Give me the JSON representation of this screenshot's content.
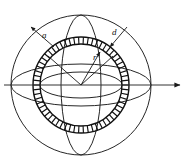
{
  "figure": {
    "background_color": "#ffffff",
    "line_color": "#1a1a1a",
    "hatch_color": "#111111"
  },
  "labels": {
    "outer_radius": "a",
    "shell_thickness": "d",
    "inner_radius": "r"
  },
  "geometry": {
    "center_x": 81,
    "center_y": 85,
    "sphere_radius": 70,
    "shell_outer_radius": 48,
    "shell_inner_radius": 41,
    "equator_ry": 21,
    "inner_ellipse_rx": 41,
    "inner_ellipse_ry": 13,
    "meridian_rx": 20,
    "hatch_count": 62,
    "axis_end_x": 182
  },
  "elements": {
    "sphere_outline": "sphere-outline",
    "equator_ellipse": "equator-ellipse",
    "meridian_ellipse": "meridian-ellipse",
    "shell_outer_circle": "shell-outer-circle",
    "shell_inner_circle": "shell-inner-circle",
    "hatching": "shell-hatching",
    "axis_arrow": "axis-arrow",
    "leader_outer_radius": "leader-a",
    "leader_thickness": "leader-d",
    "leader_inner_radius": "leader-r"
  }
}
